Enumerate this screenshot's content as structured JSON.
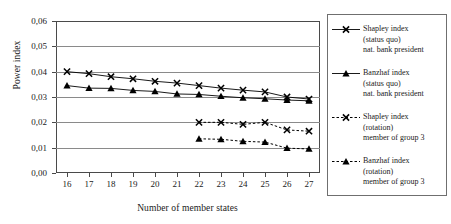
{
  "chart_data": {
    "type": "line",
    "title": "",
    "xlabel": "Number of member states",
    "ylabel": "Power index",
    "x": [
      16,
      17,
      18,
      19,
      20,
      21,
      22,
      23,
      24,
      25,
      26,
      27
    ],
    "xlim": [
      15.5,
      27.5
    ],
    "ylim": [
      0.0,
      0.06
    ],
    "ytick_labels": [
      "0,00",
      "0,01",
      "0,02",
      "0,03",
      "0,04",
      "0,05",
      "0,06"
    ],
    "ytick_values": [
      0.0,
      0.01,
      0.02,
      0.03,
      0.04,
      0.05,
      0.06
    ],
    "xtick_labels": [
      "16",
      "17",
      "18",
      "19",
      "20",
      "21",
      "22",
      "23",
      "24",
      "25",
      "26",
      "27"
    ],
    "grid": "horizontal",
    "legend_position": "right",
    "series": [
      {
        "name": "Shapley index (status quo) nat. bank president",
        "marker": "x",
        "linestyle": "solid",
        "color": "#000000",
        "x": [
          16,
          17,
          18,
          19,
          20,
          21,
          22,
          23,
          24,
          25,
          26,
          27
        ],
        "values": [
          0.04,
          0.0392,
          0.038,
          0.0372,
          0.0362,
          0.0355,
          0.0345,
          0.0335,
          0.0327,
          0.032,
          0.03,
          0.0292
        ]
      },
      {
        "name": "Banzhaf index (status quo) nat. bank president",
        "marker": "triangle",
        "linestyle": "solid",
        "color": "#000000",
        "x": [
          16,
          17,
          18,
          19,
          20,
          21,
          22,
          23,
          24,
          25,
          26,
          27
        ],
        "values": [
          0.0345,
          0.0335,
          0.0334,
          0.0326,
          0.0322,
          0.0312,
          0.031,
          0.0303,
          0.0297,
          0.0293,
          0.0288,
          0.0285
        ]
      },
      {
        "name": "Shapley index (rotation) member of group 3",
        "marker": "x",
        "linestyle": "dotted",
        "color": "#000000",
        "x": [
          22,
          23,
          24,
          25,
          26,
          27
        ],
        "values": [
          0.02,
          0.02,
          0.0192,
          0.02,
          0.017,
          0.0165
        ]
      },
      {
        "name": "Banzhaf index (rotation) member of group 3",
        "marker": "triangle",
        "linestyle": "dotted",
        "color": "#000000",
        "x": [
          22,
          23,
          24,
          25,
          26,
          27
        ],
        "values": [
          0.0135,
          0.0133,
          0.0125,
          0.0122,
          0.0098,
          0.0095
        ]
      }
    ]
  },
  "legend": {
    "entries": [
      {
        "marker": "x",
        "linestyle": "solid",
        "line1": "Shapley index",
        "line2": "(status quo)",
        "line3": "nat. bank president"
      },
      {
        "marker": "triangle",
        "linestyle": "solid",
        "line1": "Banzhaf index",
        "line2": "(status quo)",
        "line3": "nat. bank president"
      },
      {
        "marker": "x",
        "linestyle": "dotted",
        "line1": "Shapley index",
        "line2": "(rotation)",
        "line3": "member of group 3"
      },
      {
        "marker": "triangle",
        "linestyle": "dotted",
        "line1": "Banzhaf index",
        "line2": "(rotation)",
        "line3": "member of group 3"
      }
    ]
  }
}
